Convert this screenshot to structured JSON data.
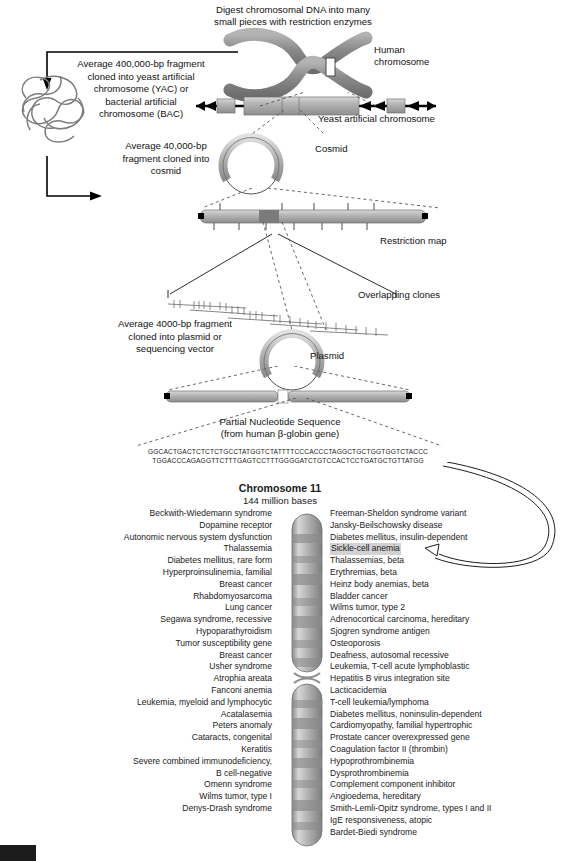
{
  "figure": {
    "digest_caption": "Digest chromosomal DNA into many\nsmall pieces with restriction enzymes",
    "human_chromosome_label": "Human\nchromosome",
    "yac_caption": "Average 400,000-bp fragment\ncloned into yeast artificial\nchromosome (YAC) or\nbacterial artificial\nchromosome (BAC)",
    "yac_label": "Yeast artificial chromosome",
    "cosmid_caption": "Average 40,000-bp\nfragment cloned into\ncosmid",
    "cosmid_label": "Cosmid",
    "restriction_map_label": "Restriction map",
    "overlapping_clones_label": "Overlapping clones",
    "plasmid_caption": "Average 4000-bp fragment\ncloned into plasmid or\nsequencing vector",
    "plasmid_label": "Plasmid",
    "sequence_title": "Partial Nucleotide Sequence\n(from human β-globin gene)",
    "sequence_line1": "GGCACTGACTCTCTCTGCCTATGGTCTATTTTCCCACCCTAGGCTGCTGGTGGTCTACCC",
    "sequence_line2": "TGGACCCAGAGGTTCTTTGAGTCCTTTGGGGATCTGTCCACTCCTGATGCTGTTATGG",
    "chromosome_title": "Chromosome 11",
    "chromosome_subtitle": "144 million bases"
  },
  "colors": {
    "chromosome_gray": "#8f8f8f",
    "ideogram_gray": "#a8a8a8",
    "highlight_gray": "#d2d2d2",
    "text": "#1a1a1a"
  },
  "diseases_left": [
    "Beckwith-Wiedemann syndrome",
    "Dopamine receptor",
    "Autonomic nervous system dysfunction",
    "Thalassemia",
    "Diabetes mellitus, rare form",
    "Hyperproinsulinemia, familial",
    "Breast cancer",
    "Rhabdomyosarcoma",
    "Lung cancer",
    "Segawa syndrome, recessive",
    "Hypoparathyroidism",
    "Tumor susceptibility gene",
    "Breast cancer",
    "Usher syndrome",
    "Atrophia areata",
    "Fanconi anemia",
    "Leukemia, myeloid and lymphocytic",
    "Acatalasemia",
    "Peters anomaly",
    "Cataracts, congenital",
    "Keratitis",
    "Severe combined immunodeficiency,",
    "B cell-negative",
    "Omenn syndrome",
    "Wilms tumor, type I",
    "Denys-Drash syndrome"
  ],
  "diseases_right": [
    "Freeman-Sheldon syndrome variant",
    "Jansky-Beilschowsky disease",
    "Diabetes mellitus, insulin-dependent",
    "Sickle-cell anemia",
    "Thalassemias, beta",
    "Erythremias, beta",
    "Heinz body anemias, beta",
    "Bladder cancer",
    "Wilms tumor, type 2",
    "Adrenocortical carcinoma, hereditary",
    "Sjogren syndrome antigen",
    "Osteoporosis",
    "Deafness, autosomal recessive",
    "Leukemia, T-cell acute lymphoblastic",
    "Hepatitis B virus integration site",
    "Lacticacidemia",
    "T-cell leukemia/lymphoma",
    "Diabetes mellitus, noninsulin-dependent",
    "Cardiomyopathy, familial hypertrophic",
    "Prostate cancer overexpressed gene",
    "Coagulation factor II (thrombin)",
    "Hypoprothrombinemia",
    "Dysprothrombinemia",
    "Complement component inhibitor",
    "Angioedema, hereditary",
    "Smith-Lemli-Opitz syndrome, types I and II",
    "IgE responsiveness, atopic",
    "Bardet-Biedi syndrome"
  ],
  "highlighted_disease": "Sickle-cell anemia"
}
